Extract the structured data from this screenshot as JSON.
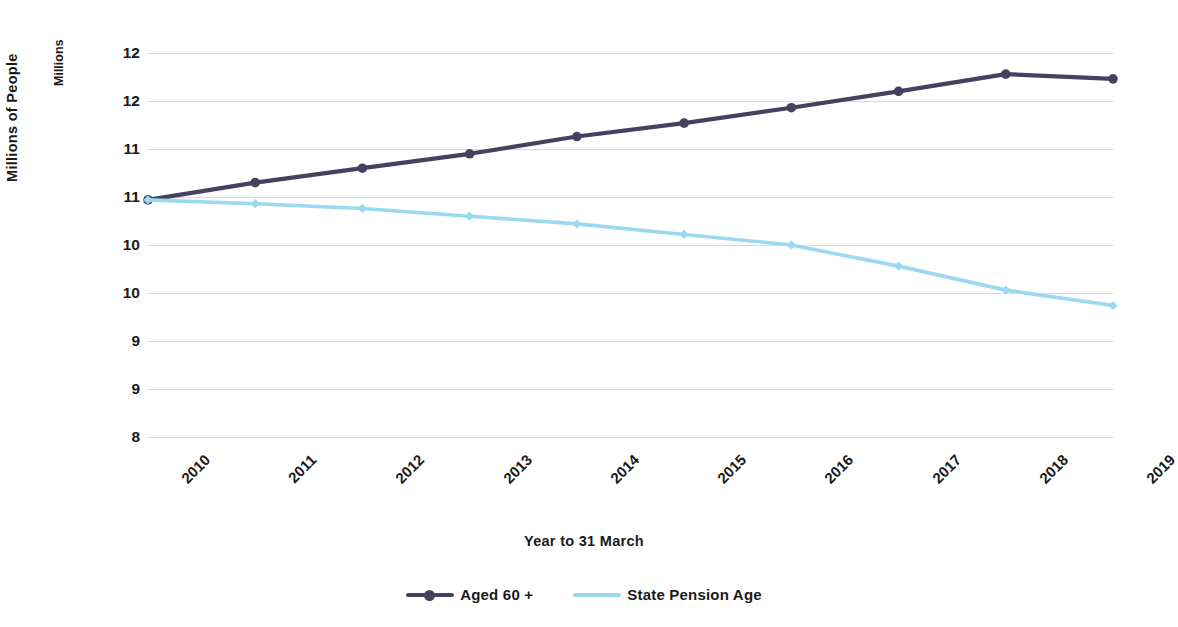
{
  "chart_data": {
    "type": "line",
    "title": "",
    "xlabel": "Year to 31 March",
    "ylabel": "Millions of People",
    "y_units_label": "Millions",
    "categories": [
      "2010",
      "2011",
      "2012",
      "2013",
      "2014",
      "2015",
      "2016",
      "2017",
      "2018",
      "2019"
    ],
    "ytick_labels": [
      "12",
      "12",
      "11",
      "11",
      "10",
      "10",
      "9",
      "9",
      "8"
    ],
    "ytick_values": [
      12.5,
      12.0,
      11.5,
      11.0,
      10.5,
      10.0,
      9.5,
      9.0,
      8.5
    ],
    "ylim": [
      8.5,
      12.5
    ],
    "grid": true,
    "legend_position": "bottom",
    "series": [
      {
        "name": "Aged 60 +",
        "color": "#45425f",
        "marker": "circle",
        "values": [
          10.97,
          11.15,
          11.3,
          11.45,
          11.63,
          11.77,
          11.93,
          12.1,
          12.28,
          12.23
        ]
      },
      {
        "name": "State Pension Age",
        "color": "#9ad9f0",
        "marker": "diamond",
        "values": [
          10.97,
          10.93,
          10.88,
          10.8,
          10.72,
          10.61,
          10.5,
          10.28,
          10.03,
          9.87
        ]
      }
    ]
  },
  "legend": {
    "items": [
      {
        "label": "Aged 60 +",
        "color": "#45425f"
      },
      {
        "label": "State Pension Age",
        "color": "#9ad9f0"
      }
    ]
  },
  "colors": {
    "gridline": "#d9d9dd",
    "text": "#1a1a1a",
    "background": "#ffffff",
    "series_dark": "#45425f",
    "series_light": "#9ad9f0"
  }
}
